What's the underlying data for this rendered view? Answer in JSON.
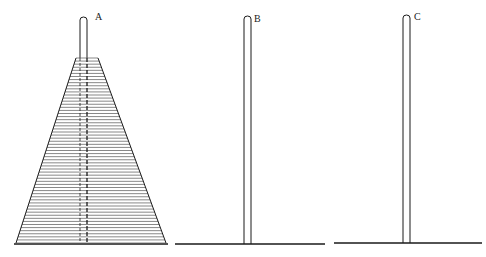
{
  "diagram": {
    "pegs": [
      {
        "label": "A",
        "x": 84,
        "top": 17,
        "base_y": 244,
        "base_x1": 14,
        "base_x2": 168,
        "disks": 60
      },
      {
        "label": "B",
        "x": 248,
        "top": 16,
        "base_y": 244,
        "base_x1": 175,
        "base_x2": 325,
        "disks": 0
      },
      {
        "label": "C",
        "x": 407,
        "top": 15,
        "base_y": 243,
        "base_x1": 334,
        "base_x2": 482,
        "disks": 0
      }
    ],
    "stack": {
      "peg": "A",
      "top_y": 58,
      "bottom_y": 243,
      "top_left_x": 76,
      "top_right_x": 98,
      "bottom_left_x": 16,
      "bottom_right_x": 166,
      "disk_count": 60
    },
    "colors": {
      "ink": "#1a1a1a",
      "disk_line": "#555555",
      "background": "#ffffff"
    }
  }
}
